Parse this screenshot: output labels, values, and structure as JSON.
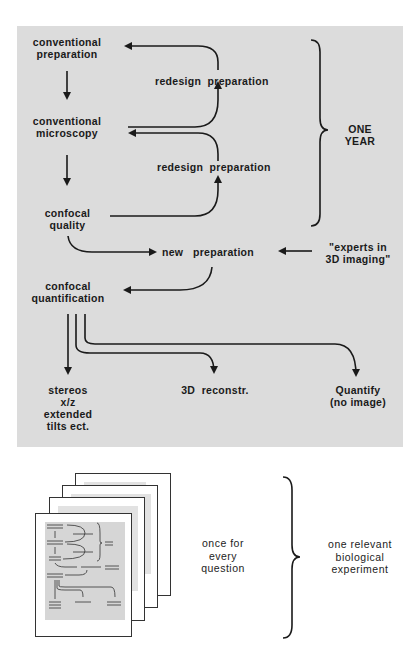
{
  "flow": {
    "nodes": {
      "conventional_preparation": "conventional\npreparation",
      "conventional_microscopy": "conventional\nmicroscopy",
      "confocal_quality": "confocal\nquality",
      "confocal_quantification": "confocal\nquantification",
      "new_preparation": "new   preparation",
      "experts": "\"experts in\n3D imaging\"",
      "redesign_1": "redesign  preparation",
      "redesign_2": "redesign  preparation"
    },
    "outputs": {
      "stereos": "stereos\nx/z\nextended\ntilts ect.",
      "reconstr": "3D  reconstr.",
      "quantify": "Quantify\n(no image)"
    },
    "brace_label": "ONE\nYEAR"
  },
  "summary": {
    "repeat_label": "once for\nevery\nquestion",
    "result_label": "one relevant\nbiological\nexperiment",
    "page_count": 4
  },
  "colors": {
    "panel": "#dcdcdc",
    "ink": "#1a1a1a",
    "page": "#ffffff"
  }
}
